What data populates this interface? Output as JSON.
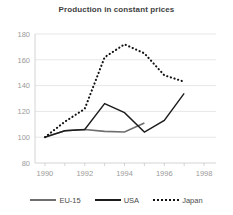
{
  "chart_data": {
    "type": "line",
    "title": "Production in constant prices",
    "xlabel": "",
    "ylabel": "",
    "xlim": [
      1989.5,
      1998.6
    ],
    "ylim": [
      80,
      180
    ],
    "grid": true,
    "legend_position": "bottom",
    "xticks": [
      "1990",
      "1992",
      "1994",
      "1996",
      "1998"
    ],
    "xtick_values": [
      1990,
      1992,
      1994,
      1996,
      1998
    ],
    "yticks": [
      "80",
      "100",
      "120",
      "140",
      "160",
      "180"
    ],
    "ytick_values": [
      80,
      100,
      120,
      140,
      160,
      180
    ],
    "x": [
      1990,
      1991,
      1992,
      1993,
      1994,
      1995,
      1996,
      1997
    ],
    "series": [
      {
        "name": "EU-15",
        "color": "#6e6e6e",
        "style": "solid",
        "x": [
          1990,
          1991,
          1992,
          1993,
          1994,
          1995
        ],
        "values": [
          100,
          105,
          106,
          104.5,
          104,
          111
        ]
      },
      {
        "name": "USA",
        "color": "#1c1c1c",
        "style": "solid",
        "x": [
          1990,
          1991,
          1992,
          1993,
          1994,
          1995,
          1996,
          1997
        ],
        "values": [
          100,
          105,
          106,
          126,
          119,
          104,
          113,
          134
        ]
      },
      {
        "name": "Japan",
        "color": "#121212",
        "style": "dotted",
        "x": [
          1990,
          1991,
          1992,
          1993,
          1994,
          1995,
          1996,
          1997
        ],
        "values": [
          100,
          112,
          122,
          162,
          172,
          165,
          148,
          143
        ]
      }
    ]
  },
  "legend": {
    "items": [
      {
        "label": "EU-15"
      },
      {
        "label": "USA"
      },
      {
        "label": "Japan"
      }
    ]
  }
}
